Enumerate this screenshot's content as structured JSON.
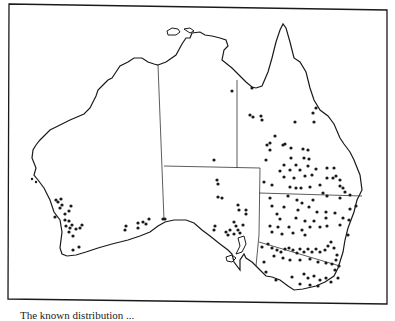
{
  "figure": {
    "caption": "The known distribution ..."
  },
  "map": {
    "region": "Australia",
    "colors": {
      "background": "#ffffff",
      "coastline": "#1a1a1a",
      "borders": "#333333",
      "dots": "#1a1a1a"
    },
    "states": [
      "Western Australia",
      "Northern Territory",
      "South Australia",
      "Queensland",
      "New South Wales",
      "Victoria",
      "Tasmania"
    ],
    "marker_style": "filled and open circles"
  }
}
